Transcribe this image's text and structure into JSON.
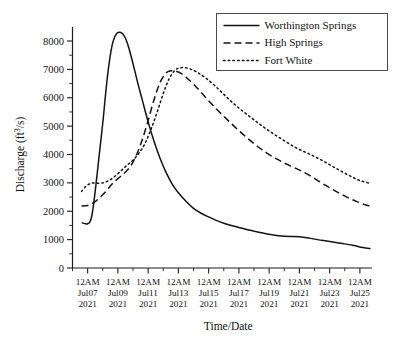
{
  "chart_data": {
    "type": "line",
    "title": "",
    "xlabel": "Time/Date",
    "ylabel": "Discharge (ft3/s)",
    "ylabel_parts": {
      "main": "Discharge (ft",
      "sup": "3",
      "tail": "/s)"
    },
    "ylim": [
      0,
      8500
    ],
    "yticks": [
      0,
      1000,
      2000,
      3000,
      4000,
      5000,
      6000,
      7000,
      8000
    ],
    "ytick_labels": [
      "0",
      "1000",
      "2000",
      "3000",
      "4000",
      "5000",
      "6000",
      "7000",
      "8000"
    ],
    "y_minor_step": 500,
    "xlim": [
      6,
      25.8
    ],
    "xticks": [
      7,
      9,
      11,
      13,
      15,
      17,
      19,
      21,
      23,
      25
    ],
    "xtick_labels": [
      {
        "time": "12AM",
        "date": "Jul07",
        "year": "2021"
      },
      {
        "time": "12AM",
        "date": "Jul09",
        "year": "2021"
      },
      {
        "time": "12AM",
        "date": "Jul11",
        "year": "2021"
      },
      {
        "time": "12AM",
        "date": "Jul13",
        "year": "2021"
      },
      {
        "time": "12AM",
        "date": "Jul15",
        "year": "2021"
      },
      {
        "time": "12AM",
        "date": "Jul17",
        "year": "2021"
      },
      {
        "time": "12AM",
        "date": "Jul19",
        "year": "2021"
      },
      {
        "time": "12AM",
        "date": "Jul21",
        "year": "2021"
      },
      {
        "time": "12AM",
        "date": "Jul23",
        "year": "2021"
      },
      {
        "time": "12AM",
        "date": "Jul25",
        "year": "2021"
      }
    ],
    "x_minor_step": 1,
    "grid": false,
    "legend_position": "top-right",
    "line_color": "#131313",
    "series": [
      {
        "name": "Worthington Springs",
        "style": "solid",
        "x": [
          6.6,
          6.85,
          7.0,
          7.15,
          7.3,
          7.5,
          7.75,
          8.0,
          8.3,
          8.6,
          8.9,
          9.2,
          9.45,
          9.7,
          10.0,
          10.3,
          10.6,
          11.0,
          11.4,
          11.8,
          12.2,
          12.6,
          13.0,
          13.5,
          14.0,
          14.5,
          15.0,
          15.5,
          16.0,
          16.5,
          17.0,
          17.5,
          18.0,
          18.6,
          19.2,
          19.8,
          20.4,
          21.0,
          21.6,
          22.2,
          22.8,
          23.4,
          24.0,
          24.6,
          25.2,
          25.7
        ],
        "y": [
          1600,
          1560,
          1560,
          1620,
          1900,
          2700,
          3900,
          5100,
          6700,
          7800,
          8250,
          8300,
          8150,
          7800,
          7200,
          6550,
          5950,
          5150,
          4450,
          3850,
          3350,
          2950,
          2650,
          2350,
          2100,
          1930,
          1800,
          1680,
          1580,
          1500,
          1430,
          1360,
          1300,
          1230,
          1170,
          1130,
          1110,
          1100,
          1060,
          1000,
          950,
          900,
          850,
          790,
          720,
          680
        ]
      },
      {
        "name": "High Springs",
        "style": "dashed",
        "x": [
          6.6,
          7.0,
          7.4,
          7.8,
          8.2,
          8.6,
          9.0,
          9.4,
          9.8,
          10.2,
          10.6,
          11.0,
          11.4,
          11.8,
          12.2,
          12.5,
          12.8,
          13.2,
          13.6,
          14.0,
          14.6,
          15.2,
          15.8,
          16.4,
          17.0,
          17.6,
          18.2,
          18.8,
          19.4,
          20.0,
          20.6,
          21.2,
          21.8,
          22.4,
          23.0,
          23.6,
          24.2,
          24.8,
          25.4,
          25.7
        ],
        "y": [
          2180,
          2200,
          2300,
          2480,
          2700,
          2950,
          3150,
          3330,
          3560,
          3950,
          4500,
          5200,
          5950,
          6550,
          6880,
          6950,
          6940,
          6850,
          6680,
          6480,
          6130,
          5780,
          5450,
          5140,
          4840,
          4560,
          4300,
          4070,
          3870,
          3700,
          3550,
          3400,
          3220,
          3020,
          2830,
          2650,
          2480,
          2340,
          2220,
          2180
        ]
      },
      {
        "name": "Fort White",
        "style": "dotted",
        "x": [
          6.6,
          6.8,
          7.0,
          7.3,
          7.6,
          8.0,
          8.4,
          8.8,
          9.2,
          9.6,
          10.0,
          10.4,
          10.8,
          11.2,
          11.6,
          12.0,
          12.4,
          12.8,
          13.1,
          13.4,
          13.8,
          14.3,
          14.8,
          15.4,
          16.0,
          16.6,
          17.2,
          17.8,
          18.4,
          19.0,
          19.6,
          20.2,
          20.8,
          21.4,
          22.0,
          22.6,
          23.2,
          23.8,
          24.4,
          25.0,
          25.7
        ],
        "y": [
          2700,
          2830,
          2930,
          2990,
          2990,
          3000,
          3080,
          3230,
          3420,
          3620,
          3800,
          4050,
          4400,
          4900,
          5500,
          6150,
          6680,
          6980,
          7050,
          7060,
          7010,
          6880,
          6700,
          6430,
          6120,
          5820,
          5550,
          5300,
          5060,
          4830,
          4620,
          4420,
          4230,
          4080,
          3930,
          3760,
          3580,
          3400,
          3230,
          3080,
          2980
        ]
      }
    ]
  },
  "legend": {
    "items": [
      {
        "label": "Worthington Springs",
        "style": "solid"
      },
      {
        "label": "High Springs",
        "style": "dashed"
      },
      {
        "label": "Fort White",
        "style": "dotted"
      }
    ]
  }
}
